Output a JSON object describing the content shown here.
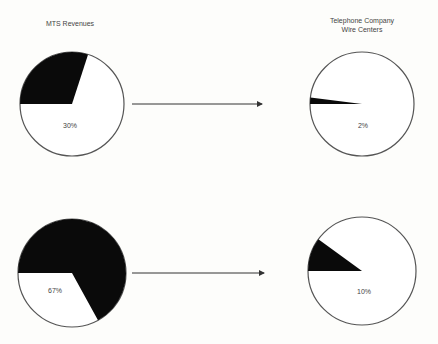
{
  "title": "",
  "labels": {
    "left": "MTS Revenues",
    "right_line1": "Telephone Company",
    "right_line2": "Wire Centers"
  },
  "colors": {
    "filled": "#0a0a0a",
    "empty": "#ffffff",
    "outline": "#555555",
    "arrow": "#333333"
  },
  "chart_data": {
    "type": "pie",
    "title": "",
    "layout": "2x2 pies with arrows from left column to right column",
    "columns": [
      "MTS Revenues",
      "Telephone Company Wire Centers"
    ],
    "rows": [
      {
        "left": {
          "label": "30%",
          "filled_share": 30
        },
        "right": {
          "label": "2%",
          "filled_share": 2
        }
      },
      {
        "left": {
          "label": "67%",
          "filled_share": 67
        },
        "right": {
          "label": "10%",
          "filled_share": 10
        }
      }
    ],
    "pies": [
      {
        "id": "top-left",
        "label": "30%",
        "value": 30,
        "cx": 72,
        "cy": 104,
        "r": 52,
        "label_x": 70,
        "label_y": 128
      },
      {
        "id": "top-right",
        "label": "2%",
        "value": 2,
        "cx": 362,
        "cy": 104,
        "r": 52,
        "label_x": 363,
        "label_y": 128
      },
      {
        "id": "bottom-left",
        "label": "67%",
        "value": 67,
        "cx": 72,
        "cy": 273,
        "r": 54,
        "label_x": 55,
        "label_y": 293
      },
      {
        "id": "bottom-right",
        "label": "10%",
        "value": 10,
        "cx": 362,
        "cy": 271,
        "r": 54,
        "label_x": 364,
        "label_y": 294
      }
    ],
    "arrows": [
      {
        "x1": 132,
        "y1": 104,
        "x2": 262,
        "y2": 104
      },
      {
        "x1": 132,
        "y1": 273,
        "x2": 264,
        "y2": 273
      }
    ]
  }
}
